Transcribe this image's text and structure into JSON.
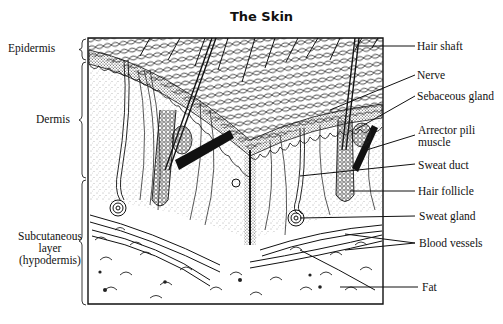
{
  "title": "The Skin",
  "layers": [
    {
      "label": "Epidermis",
      "x": 8,
      "y": 42
    },
    {
      "label": "Dermis",
      "x": 36,
      "y": 113
    },
    {
      "label_lines": [
        "Subcutaneous",
        "layer",
        "(hypodermis)"
      ],
      "x": 16,
      "y": 230
    }
  ],
  "structures": [
    {
      "label": "Hair shaft",
      "x": 417,
      "y": 41
    },
    {
      "label": "Nerve",
      "x": 417,
      "y": 70
    },
    {
      "label": "Sebaceous gland",
      "x": 417,
      "y": 90
    },
    {
      "label_lines": [
        "Arrector pili",
        "muscle"
      ],
      "x": 418,
      "y": 124
    },
    {
      "label": "Sweat duct",
      "x": 418,
      "y": 161
    },
    {
      "label": "Hair follicle",
      "x": 418,
      "y": 187
    },
    {
      "label": "Sweat gland",
      "x": 419,
      "y": 211
    },
    {
      "label": "Blood vessels",
      "x": 419,
      "y": 237
    },
    {
      "label": "Fat",
      "x": 422,
      "y": 282
    }
  ],
  "colors": {
    "ink": "#111111",
    "background": "#ffffff",
    "stipple": "#555555"
  }
}
